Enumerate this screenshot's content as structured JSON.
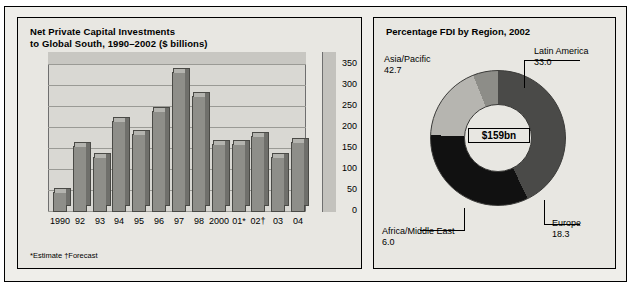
{
  "left_panel": {
    "title_line1": "Net Private Capital Investments",
    "title_line2": "to Global South, 1990–2002 ($ billions)",
    "footnote": "*Estimate †Forecast",
    "y_ticks": [
      "350",
      "300",
      "250",
      "200",
      "150",
      "100",
      "50",
      "0"
    ]
  },
  "right_panel": {
    "title": "Percentage FDI by Region, 2002",
    "center_value": "$159bn",
    "labels": [
      {
        "name": "Asia/Pacific",
        "value": "42.7"
      },
      {
        "name": "Latin America",
        "value": "33.0"
      },
      {
        "name": "Europe",
        "value": "18.3"
      },
      {
        "name": "Africa/Middle East",
        "value": "6.0"
      }
    ]
  },
  "chart_data": [
    {
      "type": "bar",
      "title": "Net Private Capital Investments to Global South, 1990–2002 ($ billions)",
      "xlabel": "",
      "ylabel": "$ billions",
      "ylim": [
        0,
        350
      ],
      "grid": true,
      "categories": [
        "1990",
        "92",
        "93",
        "94",
        "95",
        "96",
        "97",
        "98",
        "2000",
        "01*",
        "02†",
        "03",
        "04"
      ],
      "values": [
        47,
        155,
        130,
        215,
        185,
        240,
        330,
        275,
        160,
        160,
        180,
        130,
        165
      ],
      "notes": "*Estimate †Forecast"
    },
    {
      "type": "pie",
      "title": "Percentage FDI by Region, 2002",
      "center_label": "$159bn",
      "categories": [
        "Asia/Pacific",
        "Latin America",
        "Europe",
        "Africa/Middle East"
      ],
      "values": [
        42.7,
        33.0,
        18.3,
        6.0
      ],
      "colors": [
        "#4a4a48",
        "#111111",
        "#b6b5b0",
        "#8d8d88"
      ],
      "legend": "labels around chart"
    }
  ],
  "colors": {
    "page_background": "#efeeea",
    "panel_background": "#e8e7e2",
    "bar_fill": "#8e8e89",
    "border": "#000000"
  }
}
